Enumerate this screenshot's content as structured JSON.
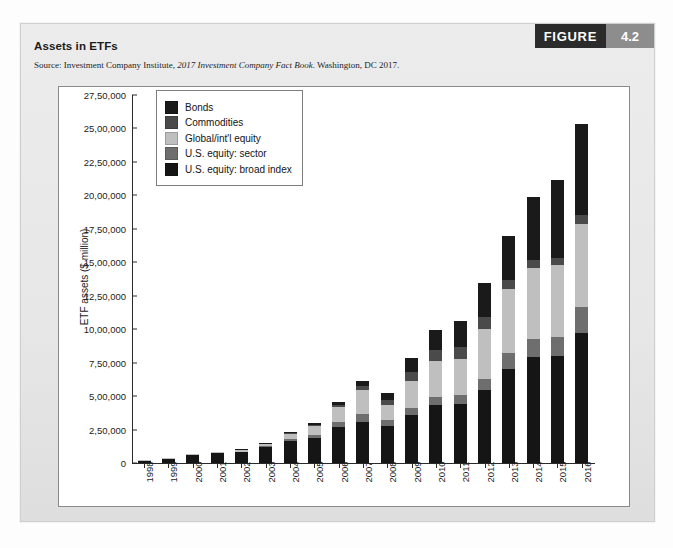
{
  "figure": {
    "badge_word": "FIGURE",
    "badge_number": "4.2",
    "title": "Assets in ETFs",
    "source_prefix": "Source: Investment Company Institute, ",
    "source_italic": "2017 Investment Company Fact Book",
    "source_suffix": ". Washington, DC 2017."
  },
  "colors": {
    "bonds": "#1a1a1a",
    "commodities": "#4a4a4a",
    "global_equity": "#bfbfbf",
    "us_sector": "#6e6e6e",
    "us_broad": "#151515",
    "badge_dark": "#2b2b2b",
    "badge_light": "#8d8d8d",
    "panel": "#e9e9e9",
    "axis": "#2a2a2a"
  },
  "chart_data": {
    "type": "bar",
    "subtype": "stacked",
    "title": "Assets in ETFs",
    "xlabel": "",
    "ylabel": "ETF assets ($ million)",
    "ylim": [
      0,
      2750000
    ],
    "ytick_labels": [
      "27,50,000",
      "25,00,000",
      "22,50,000",
      "20,00,000",
      "17,50,000",
      "15,00,000",
      "12,50,000",
      "10,00,000",
      "7,50,000",
      "5,00,000",
      "2,50,000",
      "0"
    ],
    "ytick_values": [
      2750000,
      2500000,
      2250000,
      2000000,
      1750000,
      1500000,
      1250000,
      1000000,
      750000,
      500000,
      250000,
      0
    ],
    "grid": false,
    "legend_position": "upper-left-inside",
    "categories": [
      "1998",
      "1999",
      "2000",
      "2001",
      "2002",
      "2003",
      "2004",
      "2005",
      "2006",
      "2007",
      "2008",
      "2009",
      "2010",
      "2011",
      "2012",
      "2013",
      "2014",
      "2015",
      "2016"
    ],
    "series": [
      {
        "name": "U.S. equity: broad index",
        "color": "#151515",
        "values": [
          14000,
          32000,
          62000,
          74000,
          86000,
          120000,
          164000,
          190000,
          270000,
          310000,
          280000,
          360000,
          430000,
          440000,
          545000,
          700000,
          790000,
          800000,
          975000
        ]
      },
      {
        "name": "U.S. equity: sector",
        "color": "#6e6e6e",
        "values": [
          0,
          0,
          0,
          0,
          0,
          5000,
          12000,
          22000,
          38000,
          55000,
          42000,
          50000,
          62000,
          68000,
          85000,
          120000,
          140000,
          140000,
          190000
        ]
      },
      {
        "name": "Global/int'l equity",
        "color": "#bfbfbf",
        "values": [
          1000,
          2000,
          3000,
          5000,
          8000,
          18000,
          40000,
          65000,
          110000,
          180000,
          110000,
          200000,
          270000,
          270000,
          370000,
          480000,
          530000,
          540000,
          620000
        ]
      },
      {
        "name": "Commodities",
        "color": "#4a4a4a",
        "values": [
          0,
          0,
          0,
          0,
          0,
          0,
          2000,
          5000,
          15000,
          30000,
          40000,
          70000,
          85000,
          90000,
          95000,
          70000,
          60000,
          55000,
          70000
        ]
      },
      {
        "name": "Bonds",
        "color": "#1a1a1a",
        "values": [
          0,
          0,
          0,
          0,
          3000,
          5000,
          10000,
          15000,
          20000,
          35000,
          55000,
          105000,
          145000,
          195000,
          250000,
          325000,
          470000,
          580000,
          675000
        ]
      }
    ],
    "totals": [
      15000,
      34000,
      65000,
      79000,
      97000,
      148000,
      228000,
      297000,
      453000,
      610000,
      527000,
      785000,
      992000,
      1063000,
      1345000,
      1695000,
      1990000,
      2115000,
      2530000
    ],
    "stack_order_bottom_to_top": [
      "U.S. equity: broad index",
      "U.S. equity: sector",
      "Global/int'l equity",
      "Commodities",
      "Bonds"
    ],
    "legend_entries": [
      {
        "label": "Bonds",
        "color": "#1a1a1a"
      },
      {
        "label": "Commodities",
        "color": "#4a4a4a"
      },
      {
        "label": "Global/int'l equity",
        "color": "#bfbfbf"
      },
      {
        "label": "U.S. equity: sector",
        "color": "#6e6e6e"
      },
      {
        "label": "U.S. equity: broad index",
        "color": "#151515"
      }
    ]
  }
}
